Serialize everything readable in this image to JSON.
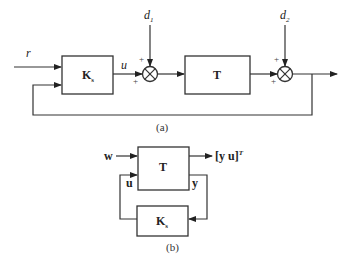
{
  "diagram_a": {
    "caption": "(a)",
    "input_label": "r",
    "controller": {
      "label": "K",
      "subscript": "s"
    },
    "control_signal": "u",
    "plant": {
      "label": "T"
    },
    "disturbance_1": {
      "label": "d",
      "subscript": "1"
    },
    "disturbance_2": {
      "label": "d",
      "subscript": "2"
    },
    "sum1_signs": {
      "top": "+",
      "left": "+"
    },
    "sum2_signs": {
      "top": "+",
      "left": "+"
    }
  },
  "diagram_b": {
    "caption": "(b)",
    "input_label": "w",
    "plant": {
      "label": "T"
    },
    "controller": {
      "label": "K",
      "subscript": "s"
    },
    "output_label": "[y  u]",
    "output_superscript": "T",
    "feedback_out_label": "y",
    "feedback_in_label": "u"
  }
}
